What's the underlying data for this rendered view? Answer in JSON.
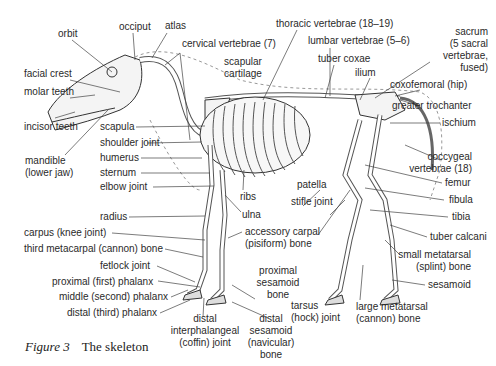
{
  "figure": {
    "number_label": "Figure 3",
    "title": "The skeleton"
  },
  "labels": {
    "orbit": "orbit",
    "occiput": "occiput",
    "atlas": "atlas",
    "cervical_vertebrae": "cervical vertebrae (7)",
    "thoracic_vertebrae": "thoracic vertebrae (18–19)",
    "lumbar_vertebrae": "lumbar vertebrae (5–6)",
    "sacrum_1": "sacrum",
    "sacrum_2": "(5 sacral",
    "sacrum_3": "vertebrae,",
    "sacrum_4": "fused)",
    "scapular_cartilage_1": "scapular",
    "scapular_cartilage_2": "cartilage",
    "tuber_coxae": "tuber coxae",
    "ilium": "ilium",
    "coxofemoral": "coxofemoral (hip)",
    "greater_trochanter": "greater trochanter",
    "ischium": "ischium",
    "coccygeal_1": "coccygeal",
    "coccygeal_2": "vertebrae (18)",
    "femur": "femur",
    "fibula": "fibula",
    "tibia": "tibia",
    "tuber_calcani": "tuber calcani",
    "small_metatarsal_1": "small metatarsal",
    "small_metatarsal_2": "(splint) bone",
    "sesamoid": "sesamoid",
    "large_metatarsal_1": "large metatarsal",
    "large_metatarsal_2": "(cannon) bone",
    "tarsus_1": "tarsus",
    "tarsus_2": "(hock) joint",
    "patella": "patella",
    "stifle_joint": "stifle joint",
    "facial_crest": "facial crest",
    "molar_teeth": "molar teeth",
    "incisor_teeth": "incisor teeth",
    "mandible_1": "mandible",
    "mandible_2": "(lower jaw)",
    "scapula": "scapula",
    "shoulder_joint": "shoulder joint",
    "humerus": "humerus",
    "sternum": "sternum",
    "elbow_joint": "elbow joint",
    "ribs": "ribs",
    "ulna": "ulna",
    "radius": "radius",
    "accessory_carpal_1": "accessory carpal",
    "accessory_carpal_2": "(pisiform) bone",
    "carpus": "carpus (knee joint)",
    "third_metacarpal": "third metacarpal (cannon) bone",
    "fetlock_joint": "fetlock joint",
    "proximal_phalanx": "proximal (first) phalanx",
    "middle_phalanx": "middle (second) phalanx",
    "distal_phalanx": "distal (third) phalanx",
    "proximal_sesamoid_1": "proximal",
    "proximal_sesamoid_2": "sesamoid",
    "proximal_sesamoid_3": "bone",
    "distal_interphalangeal_1": "distal",
    "distal_interphalangeal_2": "interphalangeal",
    "distal_interphalangeal_3": "(coffin) joint",
    "distal_sesamoid_1": "distal",
    "distal_sesamoid_2": "sesamoid",
    "distal_sesamoid_3": "(navicular)",
    "distal_sesamoid_4": "bone"
  }
}
